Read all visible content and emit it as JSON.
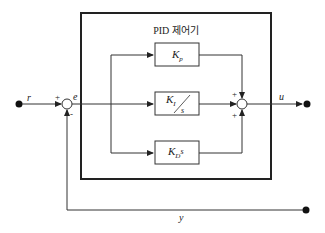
{
  "diagram": {
    "title": "PID 제어기",
    "type": "block-diagram",
    "signals": {
      "reference": "r",
      "error": "e",
      "control": "u",
      "output": "y"
    },
    "blocks": [
      {
        "id": "proportional",
        "gain": "K",
        "subscript": "p",
        "suffix": ""
      },
      {
        "id": "integral",
        "gain": "K",
        "subscript": "I",
        "denominator": "s"
      },
      {
        "id": "derivative",
        "gain": "K",
        "subscript": "D",
        "suffix": "s"
      }
    ],
    "summing_junctions": [
      {
        "id": "error-sum",
        "signs": {
          "left": "+",
          "bottom": "-"
        }
      },
      {
        "id": "output-sum",
        "signs": {
          "top": "+",
          "left": "",
          "bottom": "+"
        }
      }
    ],
    "colors": {
      "line": "#333333",
      "frame": "#222222",
      "background": "#ffffff"
    }
  }
}
